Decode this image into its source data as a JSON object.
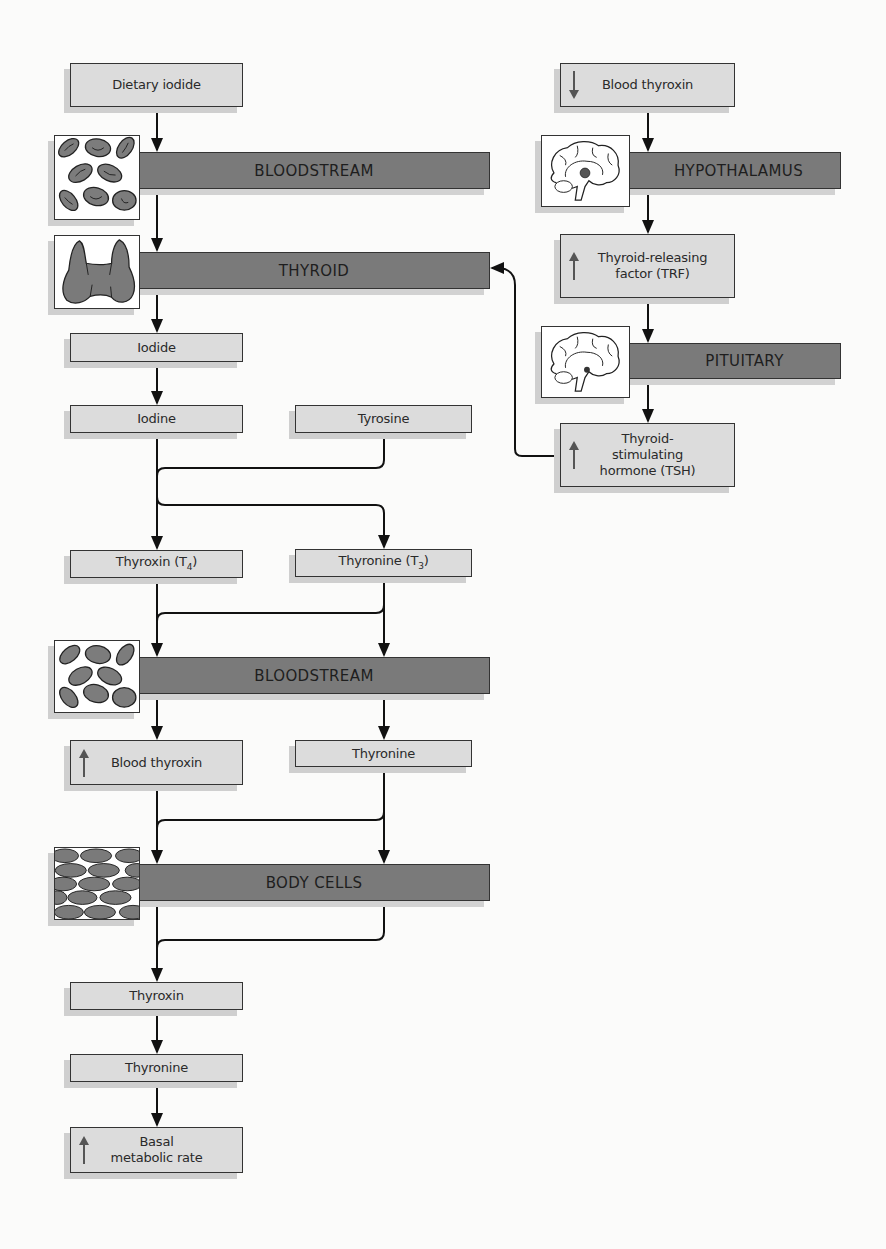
{
  "diagram": {
    "left_chain": {
      "dietary_iodide": "Dietary iodide",
      "bloodstream_1": "BLOODSTREAM",
      "thyroid": "THYROID",
      "iodide": "Iodide",
      "iodine": "Iodine",
      "tyrosine": "Tyrosine",
      "thyroxin_t4": "Thyroxin (T",
      "thyroxin_t4_sub": "4",
      "thyronine_t3": "Thyronine (T",
      "thyronine_t3_sub": "3",
      "bloodstream_2": "BLOODSTREAM",
      "blood_thyroxin_up": "Blood thyroxin",
      "thyronine_mid": "Thyronine",
      "body_cells": "BODY CELLS",
      "thyroxin_final": "Thyroxin",
      "thyronine_final": "Thyronine",
      "basal_line1": "Basal",
      "basal_line2": "metabolic rate"
    },
    "right_chain": {
      "blood_thyroxin_down": "Blood thyroxin",
      "hypothalamus": "HYPOTHALAMUS",
      "trf_line1": "Thyroid-releasing",
      "trf_line2": "factor (TRF)",
      "pituitary": "PITUITARY",
      "tsh_line1": "Thyroid-",
      "tsh_line2": "stimulating",
      "tsh_line3": "hormone (TSH)"
    },
    "indicators": {
      "increase": "up-arrow",
      "decrease": "down-arrow"
    },
    "colors": {
      "box_fill": "#dcdcdc",
      "bar_fill": "#7a7a7a",
      "line": "#111111",
      "shadow": "#cfcfcf"
    }
  }
}
